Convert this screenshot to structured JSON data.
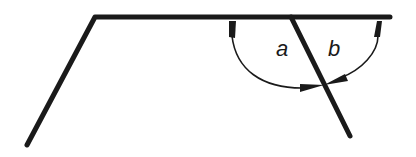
{
  "diagram": {
    "labels": {
      "angle_a": "a",
      "angle_b": "b"
    },
    "colors": {
      "stroke": "#1a1a1a",
      "background": "#ffffff"
    }
  }
}
